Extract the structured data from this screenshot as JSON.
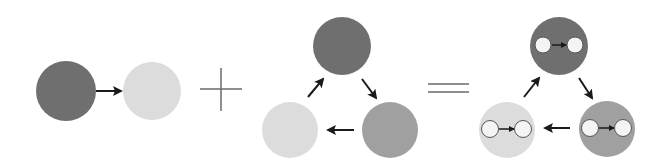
{
  "diagram": {
    "colors": {
      "dark": "#6f6f6f",
      "medium": "#a0a0a0",
      "light": "#dcdcdc",
      "arrow": "#1a1a1a",
      "operator": "#6a6a6a",
      "inner_fill": "#f4f4f4",
      "inner_stroke": "#555555"
    },
    "operators": {
      "plus": "+",
      "equals": "="
    },
    "groups": [
      {
        "name": "edge",
        "nodes": [
          {
            "id": "a",
            "shade": "dark",
            "cx": 66,
            "cy": 91,
            "r": 30
          },
          {
            "id": "b",
            "shade": "light",
            "cx": 152,
            "cy": 91,
            "r": 29
          }
        ],
        "arrows": [
          {
            "from": [
              96,
              91
            ],
            "to": [
              121,
              91
            ]
          }
        ]
      },
      {
        "name": "cycle",
        "nodes": [
          {
            "id": "top",
            "shade": "dark",
            "cx": 342,
            "cy": 46,
            "r": 29
          },
          {
            "id": "bottom-left",
            "shade": "light",
            "cx": 290,
            "cy": 130,
            "r": 28
          },
          {
            "id": "bottom-right",
            "shade": "medium",
            "cx": 390,
            "cy": 130,
            "r": 28
          }
        ],
        "arrows": [
          {
            "from": [
              308,
              97
            ],
            "to": [
              323,
              79
            ]
          },
          {
            "from": [
              362,
              79
            ],
            "to": [
              376,
              98
            ]
          },
          {
            "from": [
              354,
              130
            ],
            "to": [
              328,
              130
            ]
          }
        ]
      },
      {
        "name": "result",
        "nodes": [
          {
            "id": "top",
            "shade": "dark",
            "cx": 559,
            "cy": 46,
            "r": 29
          },
          {
            "id": "bottom-left",
            "shade": "light",
            "cx": 507,
            "cy": 130,
            "r": 28
          },
          {
            "id": "bottom-right",
            "shade": "medium",
            "cx": 607,
            "cy": 129,
            "r": 28
          }
        ],
        "arrows": [
          {
            "from": [
              524,
              97
            ],
            "to": [
              539,
              78
            ]
          },
          {
            "from": [
              579,
              78
            ],
            "to": [
              592,
              98
            ]
          },
          {
            "from": [
              570,
              128
            ],
            "to": [
              545,
              128
            ]
          }
        ]
      }
    ]
  }
}
